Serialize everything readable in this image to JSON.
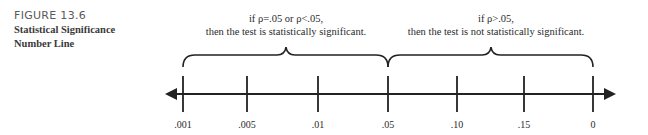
{
  "caption": {
    "figure_number": "FIGURE 13.6",
    "title_line1": "Statistical Significance",
    "title_line2": "Number Line"
  },
  "conditions": {
    "significant": {
      "line1": "if ρ=.05 or ρ<.05,",
      "line2": "then the test is statistically significant."
    },
    "not_significant": {
      "line1": "if ρ>.05,",
      "line2": "then the test is not statistically significant."
    }
  },
  "number_line": {
    "ticks": [
      ".001",
      ".005",
      ".01",
      ".05",
      ".10",
      ".15",
      "0"
    ]
  }
}
